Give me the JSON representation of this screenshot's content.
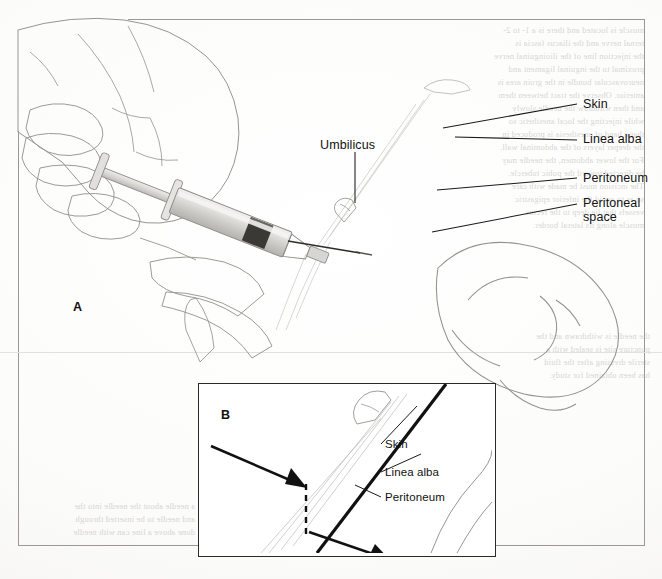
{
  "figure": {
    "type": "medical-illustration",
    "panels": [
      {
        "id": "A",
        "letter": "A"
      },
      {
        "id": "B",
        "letter": "B"
      }
    ]
  },
  "panel_a": {
    "letter": "A",
    "labels": [
      {
        "id": "umbilicus",
        "text": "Umbilicus"
      },
      {
        "id": "skin",
        "text": "Skin"
      },
      {
        "id": "linea-alba",
        "text": "Linea alba"
      },
      {
        "id": "peritoneum",
        "text": "Peritoneum"
      },
      {
        "id": "peritoneal-space",
        "text": "Peritoneal"
      },
      {
        "id": "peritoneal-space-line2",
        "text": "space"
      }
    ]
  },
  "panel_b": {
    "letter": "B",
    "labels": [
      {
        "id": "skin",
        "text": "Skin"
      },
      {
        "id": "linea-alba",
        "text": "Linea alba"
      },
      {
        "id": "peritoneum",
        "text": "Peritoneum"
      }
    ]
  },
  "bleed_text": {
    "lines": [
      "muscle is located and there is a 1- to 2-",
      "ternal nerve and the iliacus fascia is",
      "the injection line of the ilioinguinal nerve",
      "proximal to the inguinal ligament and",
      "neurovascular bundle in the groin area is",
      "anterior. Observe the tract between them",
      "and then withdraw the needle slowly",
      "while injecting the local anesthetic so",
      "that a band of anesthesia is produced in",
      "the deeper layers of the abdominal wall.",
      "For the lower abdomen, the needle may",
      "be directed toward the pubic tubercle.",
      "The incision must be made with care",
      "so as to avoid the inferior epigastric",
      "vessels that lie deep to the rectus",
      "muscle along its lateral border."
    ],
    "lower_lines": [
      "a needle about the needle into the",
      "and needle to be inserted through",
      "done above a line can with needle"
    ],
    "right_lines": [
      "the needle is withdrawn and the",
      "puncture site is sealed with a",
      "sterile dressing after the fluid",
      "has been obtained for study."
    ]
  },
  "colors": {
    "ink": "#111111",
    "leader": "#1a1a1a",
    "paper": "#fbfbfa",
    "frame": "#9a9893",
    "skin_tone": "#d2d0cc",
    "tissue_light": "#cfcdc9",
    "tissue_mid": "#a9a7a3",
    "tissue_dark": "#7d7b77",
    "peritoneal_fill": "#b9b7b3"
  }
}
